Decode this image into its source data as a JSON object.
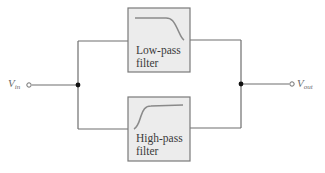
{
  "diagram": {
    "type": "block-diagram",
    "input": {
      "label": "V",
      "subscript": "in"
    },
    "output": {
      "label": "V",
      "subscript": "out"
    },
    "blocks": [
      {
        "id": "low-pass",
        "line1": "Low-pass",
        "line2": "filter",
        "response": "low-pass-curve"
      },
      {
        "id": "high-pass",
        "line1": "High-pass",
        "line2": "filter",
        "response": "high-pass-curve"
      }
    ],
    "nodes": [
      "input-junction",
      "output-junction"
    ],
    "colors": {
      "wire": "#6e6e6e",
      "box_fill": "#ececec",
      "box_border": "#7a7a7a",
      "text": "#3a3a3a",
      "junction": "#111111"
    }
  }
}
